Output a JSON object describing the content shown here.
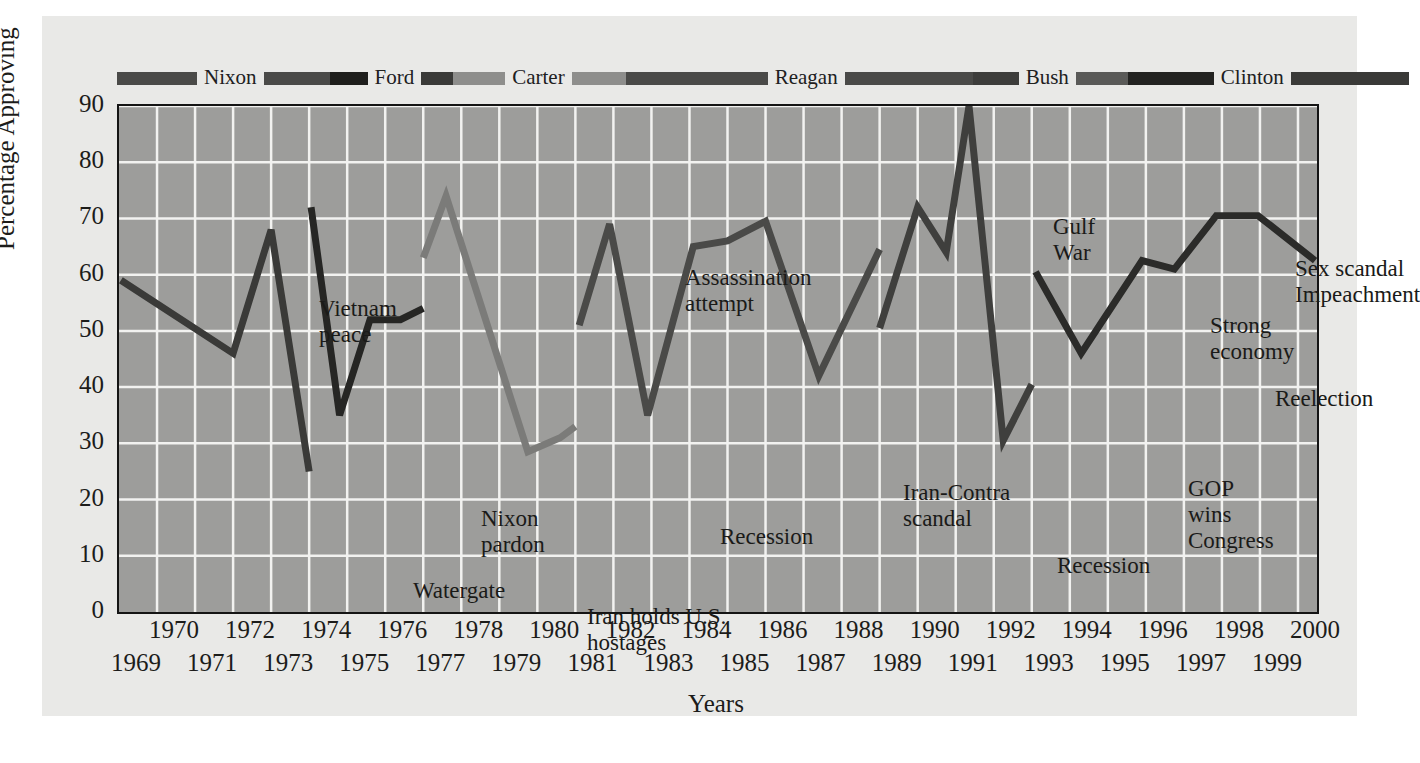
{
  "chart_data": {
    "type": "line",
    "title": "",
    "xlabel": "Years",
    "ylabel": "Percentage Approving",
    "xlim": [
      1969,
      2000.5
    ],
    "ylim": [
      0,
      90
    ],
    "ytick_labels": [
      "0",
      "10",
      "20",
      "30",
      "40",
      "50",
      "60",
      "70",
      "80",
      "90"
    ],
    "ytick_values": [
      0,
      10,
      20,
      30,
      40,
      50,
      60,
      70,
      80,
      90
    ],
    "xtick_top_labels": [
      "1970",
      "1972",
      "1974",
      "1976",
      "1978",
      "1980",
      "1982",
      "1984",
      "1986",
      "1988",
      "1990",
      "1992",
      "1994",
      "1996",
      "1998",
      "2000"
    ],
    "xtick_bottom_labels": [
      "1969",
      "1971",
      "1973",
      "1975",
      "1977",
      "1979",
      "1981",
      "1983",
      "1985",
      "1987",
      "1989",
      "1991",
      "1993",
      "1995",
      "1997",
      "1999"
    ],
    "grid": true,
    "grid_color": "#f2f2f0",
    "plot_bg": "#9d9d9b",
    "legend_position": "top",
    "series": [
      {
        "name": "Nixon",
        "color": "#3a3a38",
        "x": [
          1969.05,
          1972.0,
          1973.0,
          1974.0
        ],
        "values": [
          59,
          46,
          68,
          25
        ]
      },
      {
        "name": "Ford",
        "color": "#262624",
        "x": [
          1974.05,
          1974.8,
          1975.6,
          1976.4,
          1977.0
        ],
        "values": [
          72,
          35,
          52,
          52,
          54
        ]
      },
      {
        "name": "Carter",
        "color": "#7b7b79",
        "x": [
          1977.0,
          1977.6,
          1979.75,
          1980.6,
          1981.0
        ],
        "values": [
          63,
          74,
          28.5,
          31,
          33
        ]
      },
      {
        "name": "Reagan",
        "color": "#4a4a48",
        "x": [
          1981.1,
          1981.9,
          1982.9,
          1984.1,
          1985.0,
          1986.0,
          1987.4,
          1989.0
        ],
        "values": [
          51,
          69,
          35,
          65,
          66,
          69.5,
          42,
          64.5
        ]
      },
      {
        "name": "Bush",
        "color": "#3f3f3d",
        "x": [
          1989.0,
          1990.0,
          1990.75,
          1991.35,
          1992.25,
          1993.0
        ],
        "values": [
          50.5,
          72,
          64,
          90,
          30.5,
          40.5
        ]
      },
      {
        "name": "Clinton",
        "color": "#2b2b29",
        "x": [
          1993.1,
          1994.3,
          1995.9,
          1996.75,
          1997.85,
          1998.95,
          2000.45
        ],
        "values": [
          60.5,
          46,
          62.5,
          61,
          70.5,
          70.5,
          62.5
        ]
      }
    ],
    "annotations": [
      {
        "id": "vietnam-peace",
        "text": "Vietnam\npeace",
        "x": 200,
        "y": 190,
        "align": "lft"
      },
      {
        "id": "watergate",
        "text": "Watergate",
        "x": 340,
        "y": 472,
        "align": "ctr"
      },
      {
        "id": "nixon-pardon",
        "text": "Nixon\npardon",
        "x": 362,
        "y": 400,
        "align": "lft"
      },
      {
        "id": "iran-hostages",
        "text": "Iran holds U.S.\nhostages",
        "x": 468,
        "y": 498,
        "align": "lft"
      },
      {
        "id": "assassination",
        "text": "Assassination\nattempt",
        "x": 566,
        "y": 159,
        "align": "lft"
      },
      {
        "id": "recession-1982",
        "text": "Recession",
        "x": 601,
        "y": 418,
        "align": "lft"
      },
      {
        "id": "iran-contra",
        "text": "Iran-Contra\nscandal",
        "x": 784,
        "y": 374,
        "align": "lft"
      },
      {
        "id": "gulf-war",
        "text": "Gulf\nWar",
        "x": 934,
        "y": 108,
        "align": "lft"
      },
      {
        "id": "recession-1992",
        "text": "Recession",
        "x": 938,
        "y": 447,
        "align": "lft"
      },
      {
        "id": "gop-congress",
        "text": "GOP\nwins\nCongress",
        "x": 1069,
        "y": 370,
        "align": "lft"
      },
      {
        "id": "strong-economy",
        "text": "Strong\neconomy",
        "x": 1091,
        "y": 207,
        "align": "lft"
      },
      {
        "id": "reelection",
        "text": "Reelection",
        "x": 1156,
        "y": 280,
        "align": "lft"
      },
      {
        "id": "sex-scandal",
        "text": "Sex scandal\nImpeachment",
        "x": 1176,
        "y": 150,
        "align": "lft"
      }
    ],
    "legend_items": [
      {
        "label": "",
        "bar_color": "#4a4a48",
        "bar_width": 80
      },
      {
        "label": "Nixon",
        "bar_color": "",
        "bar_width": 0
      },
      {
        "label": "",
        "bar_color": "#4a4a48",
        "bar_width": 66
      },
      {
        "label": "",
        "bar_color": "#1e1e1c",
        "bar_width": 38
      },
      {
        "label": "Ford",
        "bar_color": "",
        "bar_width": 0
      },
      {
        "label": "",
        "bar_color": "#3a3a38",
        "bar_width": 32
      },
      {
        "label": "",
        "bar_color": "#8e8e8c",
        "bar_width": 52
      },
      {
        "label": "Carter",
        "bar_color": "",
        "bar_width": 0
      },
      {
        "label": "",
        "bar_color": "#8e8e8c",
        "bar_width": 54
      },
      {
        "label": "",
        "bar_color": "#4a4a48",
        "bar_width": 142
      },
      {
        "label": "Reagan",
        "bar_color": "",
        "bar_width": 0
      },
      {
        "label": "",
        "bar_color": "#4a4a48",
        "bar_width": 128
      },
      {
        "label": "",
        "bar_color": "#3d3d3b",
        "bar_width": 46
      },
      {
        "label": "Bush",
        "bar_color": "",
        "bar_width": 0
      },
      {
        "label": "",
        "bar_color": "#5a5a58",
        "bar_width": 52
      },
      {
        "label": "",
        "bar_color": "#232321",
        "bar_width": 86
      },
      {
        "label": "Clinton",
        "bar_color": "",
        "bar_width": 0
      },
      {
        "label": "",
        "bar_color": "#3a3a38",
        "bar_width": 118
      }
    ]
  }
}
